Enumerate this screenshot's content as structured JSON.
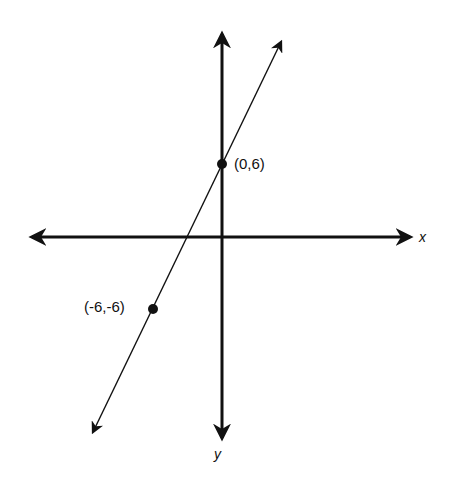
{
  "diagram": {
    "type": "coordinate-plane-line",
    "axes": {
      "x_label": "x",
      "y_label": "y"
    },
    "points": [
      {
        "label": "(0,6)",
        "x": 0,
        "y": 6
      },
      {
        "label": "(-6,-6)",
        "x": -6,
        "y": -6
      }
    ],
    "line": {
      "through": [
        "(0,6)",
        "(-6,-6)"
      ],
      "slope": 2,
      "intercept": 6
    },
    "colors": {
      "stroke": "#111111",
      "background": "#ffffff"
    }
  }
}
